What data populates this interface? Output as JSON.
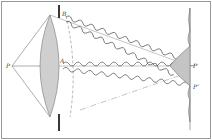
{
  "diagram": {
    "labels": {
      "source_point": "P",
      "aperture_edge": "B",
      "center_point": "A",
      "image_point": "P′",
      "secondary_point": "P″"
    },
    "colors": {
      "line": "#555555",
      "lens_fill": "#cfcfcf",
      "pattern_fill": "#c4c4c4",
      "border": "#888888",
      "aperture": "#222222"
    }
  }
}
